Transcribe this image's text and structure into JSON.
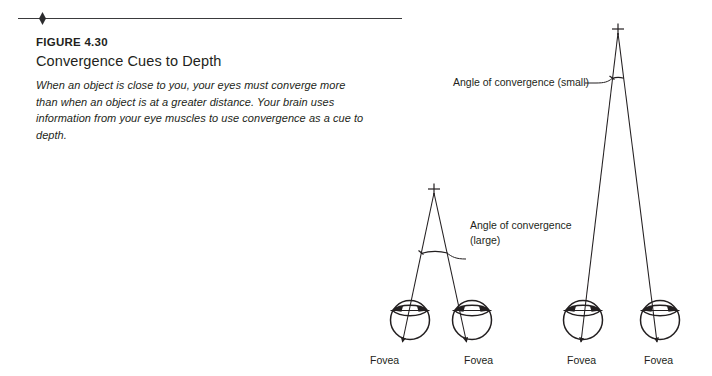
{
  "figure": {
    "number_label": "FIGURE 4.30",
    "title": "Convergence Cues to Depth",
    "body_line1": "When an object is close to you, your eyes must converge more than when",
    "body_line2": "an object is at a greater distance. Your brain uses information from your",
    "body_line3": "eye muscles to use convergence as a cue to depth."
  },
  "diagram": {
    "near": {
      "angle_label_line1": "Angle of convergence",
      "angle_label_line2": "(large)",
      "fovea_left_label": "Fovea",
      "fovea_right_label": "Fovea",
      "target_marker": "+"
    },
    "far": {
      "angle_label": "Angle of convergence (small)",
      "fovea_left_label": "Fovea",
      "fovea_right_label": "Fovea",
      "target_marker": "+"
    }
  },
  "colors": {
    "ink": "#231f20",
    "rule": "#3a3a3c",
    "background": "#ffffff"
  }
}
